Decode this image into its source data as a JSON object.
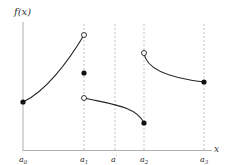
{
  "diagram": {
    "y_axis_label": "f(x)",
    "x_axis_label": "x",
    "ticks": [
      {
        "name": "a0",
        "label": "a",
        "sub": "0",
        "px": 23
      },
      {
        "name": "a1",
        "label": "a",
        "sub": "1",
        "px": 84
      },
      {
        "name": "a-prime",
        "label": "a",
        "sub": "′",
        "px": 115
      },
      {
        "name": "a2",
        "label": "a",
        "sub": "2",
        "px": 144
      },
      {
        "name": "a3",
        "label": "a",
        "sub": "3",
        "px": 204
      }
    ],
    "points": [
      {
        "name": "start-a0",
        "x": 23,
        "y": 102,
        "type": "closed"
      },
      {
        "name": "open-a1-left",
        "x": 84,
        "y": 35,
        "type": "open"
      },
      {
        "name": "value-a1",
        "x": 84,
        "y": 73,
        "type": "closed"
      },
      {
        "name": "open-a1-right",
        "x": 84,
        "y": 98,
        "type": "open"
      },
      {
        "name": "end-a2",
        "x": 144,
        "y": 123,
        "type": "closed"
      },
      {
        "name": "open-a2-right",
        "x": 144,
        "y": 53,
        "type": "open"
      },
      {
        "name": "end-a3",
        "x": 204,
        "y": 82,
        "type": "closed"
      }
    ],
    "colors": {
      "curve": "#222222",
      "axis": "#888888",
      "guide": "#999999"
    }
  }
}
